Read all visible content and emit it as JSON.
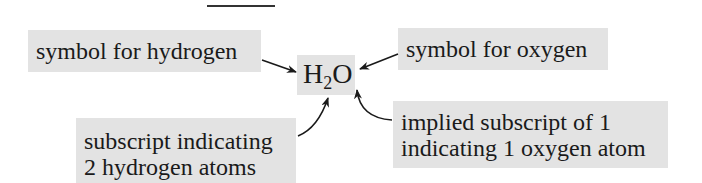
{
  "formula": {
    "element1": "H",
    "subscript": "2",
    "element2": "O"
  },
  "labels": {
    "hydrogen_symbol": "symbol for hydrogen",
    "oxygen_symbol": "symbol for oxygen",
    "subscript_line1": "subscript indicating",
    "subscript_line2": "2 hydrogen atoms",
    "implied_line1": "implied subscript of 1",
    "implied_line2": "indicating 1 oxygen atom"
  },
  "colors": {
    "label_background": "#e3e3e3",
    "text": "#1a1a1a",
    "arrow": "#1a1a1a"
  }
}
